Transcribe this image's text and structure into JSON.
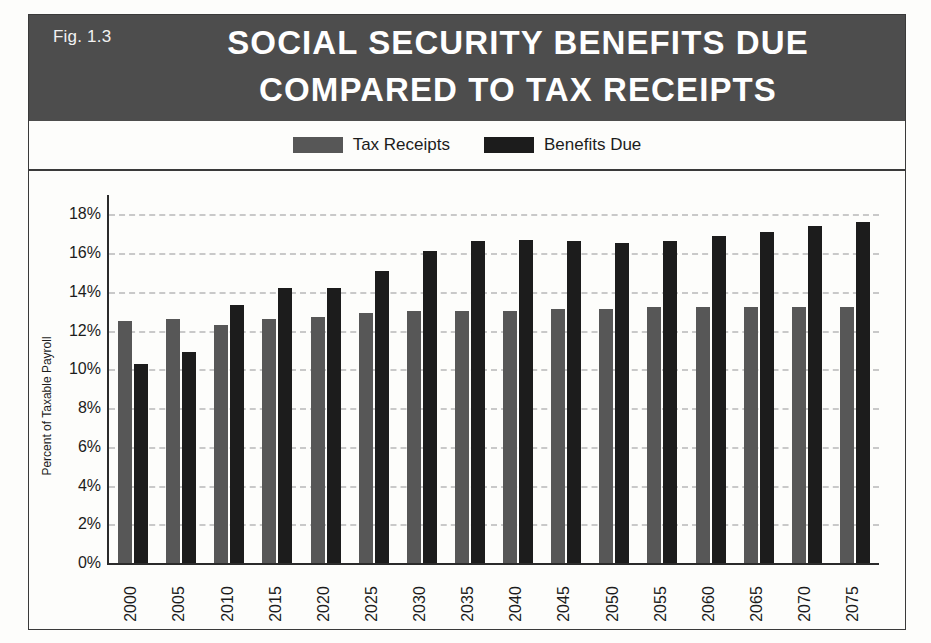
{
  "figure": {
    "fig_number": "Fig. 1.3",
    "title_line1": "SOCIAL SECURITY BENEFITS DUE",
    "title_line2": "COMPARED TO TAX RECEIPTS",
    "banner_color": "#4d4d4d"
  },
  "legend": {
    "items": [
      {
        "label": "Tax Receipts",
        "color": "#575757",
        "swatch_icon": "legend-swatch-icon"
      },
      {
        "label": "Benefits Due",
        "color": "#1c1c1c",
        "swatch_icon": "legend-swatch-icon"
      }
    ]
  },
  "chart_data": {
    "type": "bar",
    "title": "SOCIAL SECURITY BENEFITS DUE COMPARED TO TAX RECEIPTS",
    "xlabel": "",
    "ylabel": "Percent of Taxable Payroll",
    "ylim": [
      0,
      19
    ],
    "ytick_values": [
      0,
      2,
      4,
      6,
      8,
      10,
      12,
      14,
      16,
      18
    ],
    "ytick_labels": [
      "0%",
      "2%",
      "4%",
      "6%",
      "8%",
      "10%",
      "12%",
      "14%",
      "16%",
      "18%"
    ],
    "grid": true,
    "grid_style": "dashed",
    "grid_color": "#c9c9c9",
    "legend_position": "top-center",
    "categories": [
      "2000",
      "2005",
      "2010",
      "2015",
      "2020",
      "2025",
      "2030",
      "2035",
      "2040",
      "2045",
      "2050",
      "2055",
      "2060",
      "2065",
      "2070",
      "2075"
    ],
    "series": [
      {
        "name": "Tax Receipts",
        "color": "#575757",
        "values": [
          12.5,
          12.6,
          12.3,
          12.6,
          12.7,
          12.9,
          13.0,
          13.0,
          13.0,
          13.1,
          13.1,
          13.2,
          13.2,
          13.2,
          13.2,
          13.2
        ]
      },
      {
        "name": "Benefits Due",
        "color": "#1c1c1c",
        "values": [
          10.3,
          10.9,
          13.3,
          14.2,
          14.2,
          15.1,
          16.1,
          16.6,
          16.7,
          16.6,
          16.5,
          16.6,
          16.9,
          17.1,
          17.4,
          17.6
        ]
      }
    ]
  }
}
